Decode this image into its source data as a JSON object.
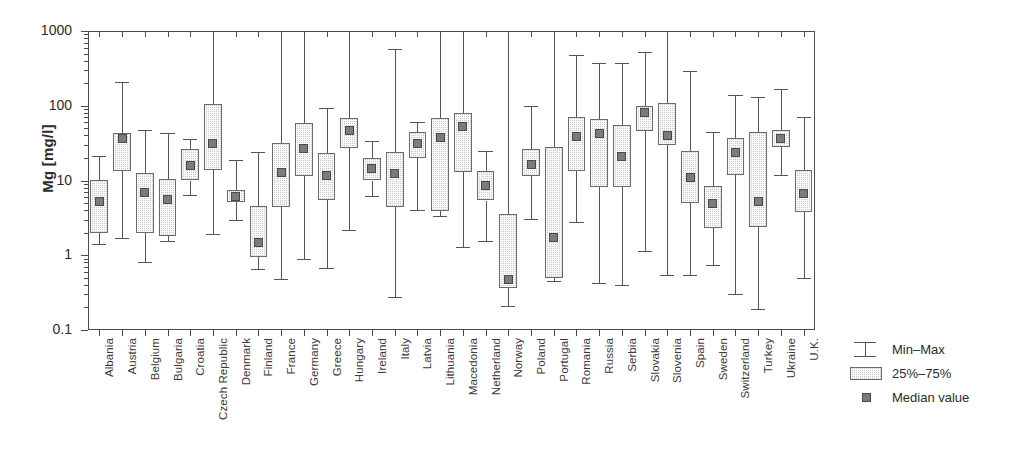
{
  "chart_data": {
    "type": "box",
    "title": "",
    "xlabel": "",
    "ylabel": "Mg [mg/l]",
    "yscale": "log",
    "ylim": [
      0.1,
      1000
    ],
    "ytick_labels": [
      "1000",
      "100",
      "10",
      "1",
      "0.1"
    ],
    "ytick_values": [
      1000,
      100,
      10,
      1,
      0.1
    ],
    "grid": false,
    "legend_position": "right",
    "legend": [
      {
        "key": "min-max",
        "label": "Min–Max"
      },
      {
        "key": "quartiles",
        "label": "25%–75%"
      },
      {
        "key": "median",
        "label": "Median value"
      }
    ],
    "categories": [
      "Albania",
      "Austria",
      "Belgium",
      "Bulgaria",
      "Croatia",
      "Czech Republic",
      "Denmark",
      "Finland",
      "France",
      "Germany",
      "Greece",
      "Hungary",
      "Ireland",
      "Italy",
      "Latvia",
      "Lithuania",
      "Macedonia",
      "Netherland",
      "Norway",
      "Poland",
      "Portugal",
      "Romania",
      "Russia",
      "Serbia",
      "Slovakia",
      "Slovenia",
      "Spain",
      "Sweden",
      "Switzerland",
      "Turkey",
      "Ukraine",
      "U.K."
    ],
    "boxes": [
      {
        "category": "Albania",
        "min": 1.4,
        "q1": 2.0,
        "median": 5.2,
        "q3": 10.2,
        "max": 21.0
      },
      {
        "category": "Austria",
        "min": 1.7,
        "q1": 13.5,
        "median": 37.0,
        "q3": 43.0,
        "max": 210.0
      },
      {
        "category": "Belgium",
        "min": 0.8,
        "q1": 2.0,
        "median": 7.0,
        "q3": 12.5,
        "max": 47.0
      },
      {
        "category": "Bulgaria",
        "min": 1.55,
        "q1": 1.8,
        "median": 5.5,
        "q3": 10.5,
        "max": 43.0
      },
      {
        "category": "Croatia",
        "min": 6.3,
        "q1": 10.0,
        "median": 16.0,
        "q3": 26.0,
        "max": 36.0
      },
      {
        "category": "Czech Republic",
        "min": 1.9,
        "q1": 14.0,
        "median": 31.0,
        "q3": 105.0,
        "max": 1000.0
      },
      {
        "category": "Denmark",
        "min": 3.0,
        "q1": 5.2,
        "median": 6.2,
        "q3": 7.5,
        "max": 19.0
      },
      {
        "category": "Finland",
        "min": 0.65,
        "q1": 0.95,
        "median": 1.5,
        "q3": 4.6,
        "max": 24.0
      },
      {
        "category": "France",
        "min": 0.48,
        "q1": 4.4,
        "median": 12.8,
        "q3": 32.0,
        "max": 1000.0
      },
      {
        "category": "Germany",
        "min": 0.9,
        "q1": 11.5,
        "median": 27.0,
        "q3": 59.0,
        "max": 1000.0
      },
      {
        "category": "Greece",
        "min": 0.68,
        "q1": 5.5,
        "median": 11.5,
        "q3": 23.0,
        "max": 94.0
      },
      {
        "category": "Hungary",
        "min": 2.2,
        "q1": 27.0,
        "median": 47.0,
        "q3": 68.0,
        "max": 1000.0
      },
      {
        "category": "Ireland",
        "min": 6.2,
        "q1": 10.0,
        "median": 14.5,
        "q3": 20.0,
        "max": 34.0
      },
      {
        "category": "Italy",
        "min": 0.28,
        "q1": 4.4,
        "median": 12.5,
        "q3": 24.0,
        "max": 570.0
      },
      {
        "category": "Latvia",
        "min": 4.0,
        "q1": 20.0,
        "median": 31.0,
        "q3": 44.0,
        "max": 60.0
      },
      {
        "category": "Lithuania",
        "min": 3.4,
        "q1": 3.9,
        "median": 38.0,
        "q3": 68.0,
        "max": 1000.0
      },
      {
        "category": "Macedonia",
        "min": 1.3,
        "q1": 13.0,
        "median": 53.0,
        "q3": 80.0,
        "max": 1000.0
      },
      {
        "category": "Netherland",
        "min": 1.55,
        "q1": 5.4,
        "median": 8.5,
        "q3": 13.5,
        "max": 25.0
      },
      {
        "category": "Norway",
        "min": 0.21,
        "q1": 0.36,
        "median": 0.48,
        "q3": 3.6,
        "max": 1000.0
      },
      {
        "category": "Poland",
        "min": 3.1,
        "q1": 11.5,
        "median": 16.5,
        "q3": 26.0,
        "max": 100.0
      },
      {
        "category": "Portugal",
        "min": 0.45,
        "q1": 0.5,
        "median": 1.75,
        "q3": 28.0,
        "max": 1000.0
      },
      {
        "category": "Romania",
        "min": 2.8,
        "q1": 13.5,
        "median": 39.0,
        "q3": 70.0,
        "max": 480.0
      },
      {
        "category": "Russia",
        "min": 0.42,
        "q1": 8.2,
        "median": 42.0,
        "q3": 67.0,
        "max": 370.0
      },
      {
        "category": "Serbia",
        "min": 0.4,
        "q1": 8.3,
        "median": 21.0,
        "q3": 56.0,
        "max": 370.0
      },
      {
        "category": "Slovakia",
        "min": 1.15,
        "q1": 46.0,
        "median": 80.0,
        "q3": 100.0,
        "max": 520.0
      },
      {
        "category": "Slovenia",
        "min": 0.55,
        "q1": 30.0,
        "median": 40.0,
        "q3": 110.0,
        "max": 1000.0
      },
      {
        "category": "Spain",
        "min": 0.55,
        "q1": 5.0,
        "median": 11.0,
        "q3": 25.0,
        "max": 290.0
      },
      {
        "category": "Sweden",
        "min": 0.75,
        "q1": 2.3,
        "median": 5.0,
        "q3": 8.5,
        "max": 44.0
      },
      {
        "category": "Switzerland",
        "min": 0.3,
        "q1": 12.0,
        "median": 24.0,
        "q3": 37.0,
        "max": 140.0
      },
      {
        "category": "Turkey",
        "min": 0.19,
        "q1": 2.4,
        "median": 5.2,
        "q3": 44.0,
        "max": 130.0
      },
      {
        "category": "Ukraine",
        "min": 12.0,
        "q1": 28.0,
        "median": 36.0,
        "q3": 47.0,
        "max": 170.0
      },
      {
        "category": "U.K.",
        "min": 0.5,
        "q1": 3.8,
        "median": 6.8,
        "q3": 14.0,
        "max": 70.0
      }
    ]
  },
  "axis": {
    "ylabel": "Mg [mg/l]"
  },
  "colors": {
    "box_fill": "#c9c9c9",
    "box_edge": "#6a6a6a",
    "median_fill": "#7b7b7b",
    "whisker": "#555555",
    "frame": "#4a4a4a",
    "text": "#2b2b2b"
  }
}
